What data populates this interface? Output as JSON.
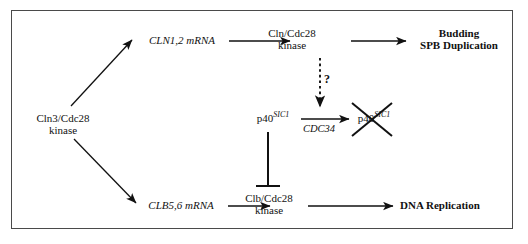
{
  "figure": {
    "border_color": "#4a4a4a",
    "ink_color": "#111111",
    "width": 528,
    "height": 244
  },
  "nodes": {
    "cln3_cdc28": {
      "line1": "Cln3/Cdc28",
      "line2": "kinase",
      "style": "roman"
    },
    "cln12_mrna": {
      "text": "CLN1,2 mRNA",
      "style": "italic"
    },
    "cln_cdc28": {
      "line1": "Cln/Cdc28",
      "line2": "kinase",
      "style": "roman"
    },
    "budding_spb": {
      "line1": "Budding",
      "line2": "SPB Duplication",
      "style": "bold"
    },
    "p40_sic1": {
      "base": "p40",
      "sup": "SIC1",
      "style": "roman-with-italic-superscript"
    },
    "p40_sic1_degraded": {
      "base": "p40",
      "sup": "SIC1",
      "style": "roman-with-italic-superscript",
      "crossed_out": true
    },
    "clb56_mrna": {
      "text": "CLB5,6 mRNA",
      "style": "italic"
    },
    "clb_cdc28": {
      "line1": "Clb/Cdc28",
      "line2": "kinase",
      "style": "roman"
    },
    "dna_replication": {
      "text": "DNA Replication",
      "style": "bold"
    }
  },
  "edge_labels": {
    "cdc34": "CDC34",
    "question": "?"
  },
  "edges": [
    {
      "name": "cln3-to-cln12-mrna",
      "kind": "arrow",
      "from": "cln3_cdc28",
      "to": "cln12_mrna"
    },
    {
      "name": "cln12-mrna-to-cln-cdc28",
      "kind": "arrow",
      "from": "cln12_mrna",
      "to": "cln_cdc28"
    },
    {
      "name": "cln-cdc28-to-budding",
      "kind": "arrow",
      "from": "cln_cdc28",
      "to": "budding_spb"
    },
    {
      "name": "cln-cdc28-to-degradation",
      "kind": "dashed-arrow",
      "from": "cln_cdc28",
      "to": "cdc34-arrow",
      "label": "?"
    },
    {
      "name": "p40sic1-degradation",
      "kind": "arrow",
      "from": "p40_sic1",
      "to": "p40_sic1_degraded",
      "label": "CDC34"
    },
    {
      "name": "cln3-to-clb56-mrna",
      "kind": "arrow",
      "from": "cln3_cdc28",
      "to": "clb56_mrna"
    },
    {
      "name": "clb56-mrna-to-clb-cdc28",
      "kind": "arrow",
      "from": "clb56_mrna",
      "to": "clb_cdc28"
    },
    {
      "name": "clb-cdc28-to-dna-replication",
      "kind": "arrow",
      "from": "clb_cdc28",
      "to": "dna_replication"
    },
    {
      "name": "p40sic1-inhibits-clb-cdc28",
      "kind": "inhibition",
      "from": "p40_sic1",
      "to": "clb_cdc28"
    }
  ]
}
